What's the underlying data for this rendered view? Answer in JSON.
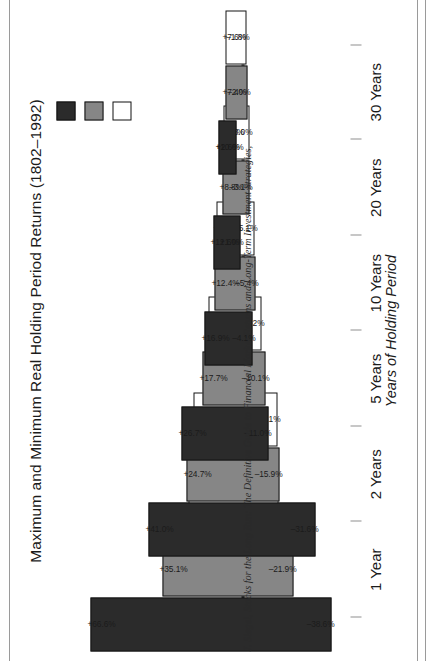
{
  "chart_data": {
    "type": "bar",
    "title": "Maximum and Minimum Real Holding Period Returns (1802–1992)",
    "xlabel": "Years of Holding Period",
    "ylabel": "",
    "orientation": "rotated-90-ccw",
    "grid": false,
    "legend_position": "top-right",
    "ylim": [
      -40,
      70
    ],
    "categories": [
      "1 Year",
      "2 Years",
      "5 Years",
      "10 Years",
      "20 Years",
      "30 Years"
    ],
    "series": [
      {
        "name": "Stocks",
        "color": "#2b2b2b",
        "max_values": [
          66.6,
          41.0,
          26.7,
          16.9,
          12.6,
          10.6
        ],
        "min_values": [
          -38.6,
          -31.6,
          -11.0,
          -4.1,
          1.0,
          2.6
        ],
        "max_labels": [
          "+66.6%",
          "+41.0%",
          "+26.7%",
          "+16.9%",
          "+12.6%",
          "+10.6%"
        ],
        "min_labels": [
          "–38.6%",
          "–31.6%",
          "–11.0%",
          "–4.1%",
          "+1.0%",
          "+2.6%"
        ]
      },
      {
        "name": "Bonds",
        "color": "#868686",
        "max_values": [
          35.1,
          24.7,
          17.7,
          12.4,
          8.8,
          7.4
        ],
        "min_values": [
          -21.9,
          -15.9,
          -10.1,
          -5.4,
          -3.1,
          -2.0
        ],
        "max_labels": [
          "+35.1%",
          "+24.7%",
          "+17.7%",
          "+12.4%",
          "+8.8%",
          "+7.4%"
        ],
        "min_labels": [
          "–21.9%",
          "–15.9%",
          "–10.1%",
          "–5.4%",
          "–3.1%",
          "–2.0%"
        ]
      },
      {
        "name": "T-Bills",
        "color": "#ffffff",
        "max_values": [
          23.7,
          21.6,
          14.9,
          11.6,
          8.3,
          7.6
        ],
        "min_values": [
          -15.6,
          -15.1,
          -8.2,
          -5.1,
          -3.0,
          -1.8
        ],
        "max_labels": [
          "+23.7%",
          "+21.6%",
          "+14.9%",
          "+11.6%",
          "+8.3%",
          "+7.6%"
        ],
        "min_labels": [
          "–15.6%",
          "–15.1%",
          "–8.2%",
          "–5.1%",
          "–3.0%",
          "–1.8%"
        ]
      }
    ]
  },
  "legend": {
    "items": [
      {
        "label": "Stocks",
        "swatch": "stocks"
      },
      {
        "label": "Bonds",
        "swatch": "bonds"
      },
      {
        "label": "T-Bills",
        "swatch": "tbills"
      }
    ]
  },
  "caption": {
    "text": "J. Siegel, Stocks for the Long Run: The Definitive Guide to Financial Market Returns and Long-Term Investment Strategies,"
  }
}
